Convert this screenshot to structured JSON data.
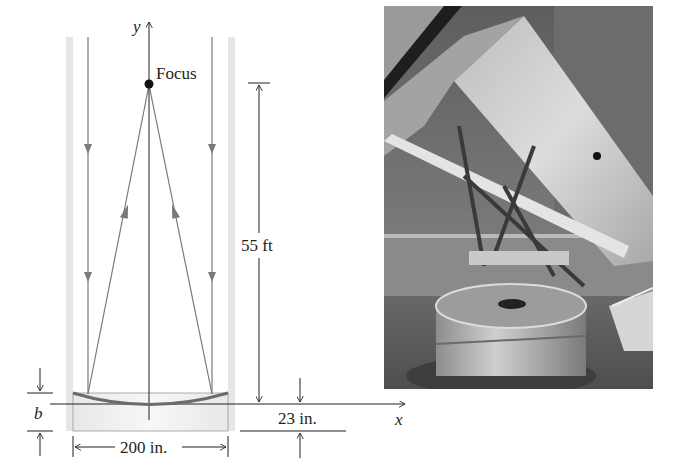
{
  "diagram": {
    "axis_labels": {
      "x": "x",
      "y": "y"
    },
    "focus_label": "Focus",
    "dimensions": {
      "focal_length": "55 ft",
      "mirror_diameter": "200 in.",
      "mirror_thickness": "23 in.",
      "depth_variable": "b"
    },
    "colors": {
      "ink": "#231f20",
      "ray": "#7a7a7a",
      "tube_wall": "#e6e6e6",
      "mirror": "#6b6b6b"
    }
  },
  "photo": {
    "subject": "telescope-photo",
    "description": "Large reflecting telescope with white tube, truss frame, and 200-inch mirror cell in observatory dome"
  }
}
